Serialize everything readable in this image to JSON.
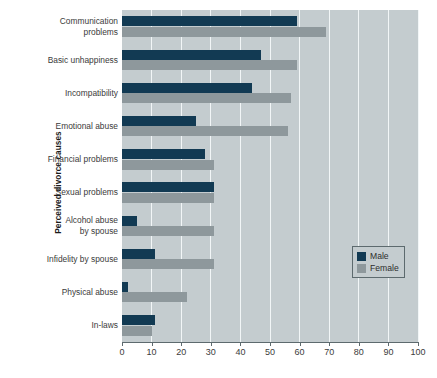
{
  "chart_data": {
    "type": "bar",
    "orientation": "horizontal",
    "title": "",
    "xlabel": "",
    "ylabel": "Perceived divorce causes",
    "xlim": [
      0,
      100
    ],
    "xticks": [
      0,
      10,
      20,
      30,
      40,
      50,
      60,
      70,
      80,
      90,
      100
    ],
    "grid": true,
    "legend_position": "middle right",
    "categories": [
      "Communication problems",
      "Basic unhappiness",
      "Incompatibility",
      "Emotional abuse",
      "Financial problems",
      "Sexual problems",
      "Alcohol abuse by spouse",
      "Infidelity by spouse",
      "Physical abuse",
      "In-laws"
    ],
    "series": [
      {
        "name": "Male",
        "color": "#123a53",
        "values": [
          59,
          47,
          44,
          25,
          28,
          31,
          5,
          11,
          2,
          11
        ]
      },
      {
        "name": "Female",
        "color": "#8e989c",
        "values": [
          69,
          59,
          57,
          56,
          31,
          31,
          31,
          31,
          22,
          10
        ]
      }
    ]
  },
  "axes": {
    "y_title": "Perceived divorce causes",
    "category_labels": [
      [
        "Communication",
        "problems"
      ],
      [
        "Basic unhappiness"
      ],
      [
        "Incompatibility"
      ],
      [
        "Emotional abuse"
      ],
      [
        "Financial problems"
      ],
      [
        "Sexual problems"
      ],
      [
        "Alcohol abuse",
        "by spouse"
      ],
      [
        "Infidelity by spouse"
      ],
      [
        "Physical abuse"
      ],
      [
        "In-laws"
      ]
    ],
    "x_tick_labels": [
      "0",
      "10",
      "20",
      "30",
      "40",
      "50",
      "60",
      "70",
      "80",
      "90",
      "100"
    ]
  },
  "legend": {
    "entries": [
      {
        "label": "Male",
        "color": "#123a53"
      },
      {
        "label": "Female",
        "color": "#8e989c"
      }
    ]
  },
  "colors": {
    "male": "#123a53",
    "female": "#8e989c",
    "plot_background": "#c4cccf",
    "gridline": "#f2f6f7",
    "axis": "#5d6a6e",
    "page_background": "#ffffff"
  }
}
